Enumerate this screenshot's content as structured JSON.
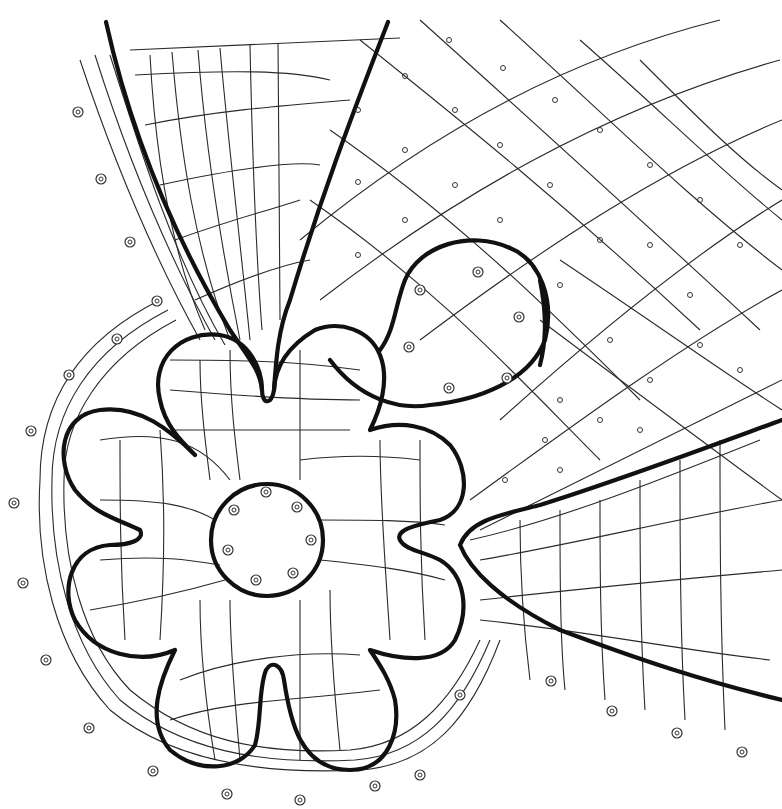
{
  "diagram": {
    "type": "bobbin-lace-pricking",
    "background": "#ffffff",
    "stroke_color": "#111111",
    "elements": {
      "flower": {
        "petals": 5,
        "center": [
          267,
          540
        ],
        "inner_ring_radius": 56
      },
      "circle_motif": {
        "center": [
          470,
          325
        ],
        "radius": 72
      },
      "side_loops_edge_pins_left": [
        [
          78,
          112
        ],
        [
          101,
          179
        ],
        [
          130,
          242
        ],
        [
          157,
          301
        ],
        [
          117,
          339
        ],
        [
          69,
          375
        ],
        [
          31,
          431
        ],
        [
          14,
          503
        ],
        [
          23,
          583
        ],
        [
          46,
          660
        ],
        [
          89,
          728
        ],
        [
          153,
          771
        ],
        [
          227,
          794
        ],
        [
          300,
          800
        ],
        [
          375,
          786
        ]
      ],
      "edge_pins_bottom_right": [
        [
          460,
          695
        ],
        [
          551,
          681
        ],
        [
          612,
          711
        ],
        [
          677,
          733
        ],
        [
          742,
          752
        ],
        [
          420,
          775
        ]
      ]
    }
  }
}
